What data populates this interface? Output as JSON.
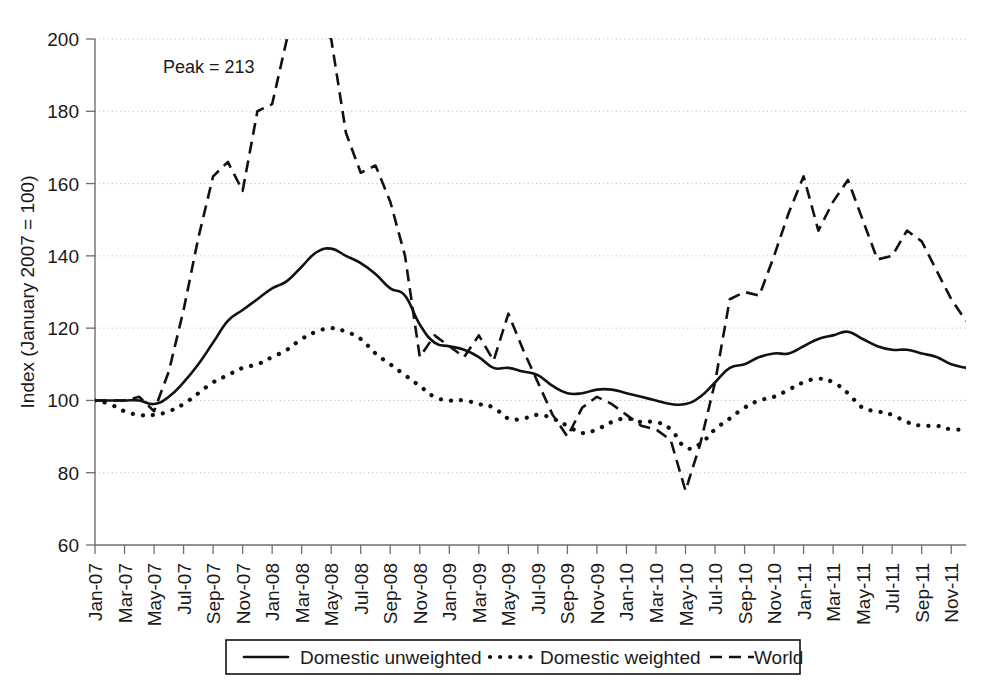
{
  "chart_data": {
    "type": "line",
    "title": "",
    "xlabel": "",
    "ylabel": "Index (January 2007 = 100)",
    "ylim": [
      60,
      200
    ],
    "yticks": [
      60,
      80,
      100,
      120,
      140,
      160,
      180,
      200
    ],
    "grid": true,
    "legend_position": "bottom",
    "annotations": [
      {
        "text": "Peak = 213",
        "series": "World",
        "note": "World series exceeds the 200 top of axis near Jan-08 to Mar-08"
      }
    ],
    "x": [
      "Jan-07",
      "Feb-07",
      "Mar-07",
      "Apr-07",
      "May-07",
      "Jun-07",
      "Jul-07",
      "Aug-07",
      "Sep-07",
      "Oct-07",
      "Nov-07",
      "Dec-07",
      "Jan-08",
      "Feb-08",
      "Mar-08",
      "Apr-08",
      "May-08",
      "Jun-08",
      "Jul-08",
      "Aug-08",
      "Sep-08",
      "Oct-08",
      "Nov-08",
      "Dec-08",
      "Jan-09",
      "Feb-09",
      "Mar-09",
      "Apr-09",
      "May-09",
      "Jun-09",
      "Jul-09",
      "Aug-09",
      "Sep-09",
      "Oct-09",
      "Nov-09",
      "Dec-09",
      "Jan-10",
      "Feb-10",
      "Mar-10",
      "Apr-10",
      "May-10",
      "Jun-10",
      "Jul-10",
      "Aug-10",
      "Sep-10",
      "Oct-10",
      "Nov-10",
      "Dec-10",
      "Jan-11",
      "Feb-11",
      "Mar-11",
      "Apr-11",
      "May-11",
      "Jun-11",
      "Jul-11",
      "Aug-11",
      "Sep-11",
      "Oct-11",
      "Nov-11",
      "Dec-11"
    ],
    "xticklabels": [
      "Jan-07",
      "Mar-07",
      "May-07",
      "Jul-07",
      "Sep-07",
      "Nov-07",
      "Jan-08",
      "Mar-08",
      "May-08",
      "Jul-08",
      "Sep-08",
      "Nov-08",
      "Jan-09",
      "Mar-09",
      "May-09",
      "Jul-09",
      "Sep-09",
      "Nov-09",
      "Jan-10",
      "Mar-10",
      "May-10",
      "Jul-10",
      "Sep-10",
      "Nov-10",
      "Jan-11",
      "Mar-11",
      "May-11",
      "Jul-11",
      "Sep-11",
      "Nov-11"
    ],
    "series": [
      {
        "name": "Domestic unweighted",
        "style": "solid",
        "values": [
          100,
          100,
          100,
          100,
          99,
          101,
          105,
          110,
          116,
          122,
          125,
          128,
          131,
          133,
          137,
          141,
          142,
          140,
          138,
          135,
          131,
          129,
          121,
          116,
          115,
          114,
          112,
          109,
          109,
          108,
          107,
          104,
          102,
          102,
          103,
          103,
          102,
          101,
          100,
          99,
          99,
          101,
          105,
          109,
          110,
          112,
          113,
          113,
          115,
          117,
          118,
          119,
          117,
          115,
          114,
          114,
          113,
          112,
          110,
          109
        ]
      },
      {
        "name": "Domestic weighted",
        "style": "dotted",
        "values": [
          100,
          99,
          97,
          96,
          96,
          97,
          99,
          102,
          105,
          107,
          109,
          110,
          112,
          114,
          117,
          119,
          120,
          119,
          117,
          113,
          110,
          107,
          104,
          101,
          100,
          100,
          99,
          98,
          95,
          95,
          96,
          95,
          93,
          91,
          92,
          94,
          95,
          94,
          94,
          92,
          87,
          88,
          92,
          95,
          98,
          100,
          101,
          103,
          105,
          106,
          105,
          102,
          98,
          97,
          96,
          94,
          93,
          93,
          92,
          92
        ]
      },
      {
        "name": "World",
        "style": "dashed",
        "values": [
          100,
          100,
          100,
          101,
          97,
          108,
          125,
          145,
          162,
          166,
          158,
          180,
          182,
          200,
          213,
          205,
          200,
          174,
          163,
          165,
          155,
          140,
          112,
          118,
          115,
          112,
          118,
          111,
          124,
          114,
          105,
          96,
          90,
          98,
          101,
          99,
          96,
          93,
          92,
          89,
          75,
          88,
          105,
          128,
          130,
          129,
          140,
          152,
          162,
          147,
          155,
          161,
          150,
          139,
          140,
          147,
          144,
          136,
          128,
          122
        ]
      }
    ]
  },
  "legend": {
    "items": [
      {
        "label": "Domestic unweighted",
        "style": "solid"
      },
      {
        "label": "Domestic weighted",
        "style": "dotted"
      },
      {
        "label": "World",
        "style": "dashed"
      }
    ]
  },
  "colors": {
    "line": "#111111",
    "axis": "#6e6e6e",
    "grid": "#b9b9b9",
    "background": "#ffffff"
  }
}
